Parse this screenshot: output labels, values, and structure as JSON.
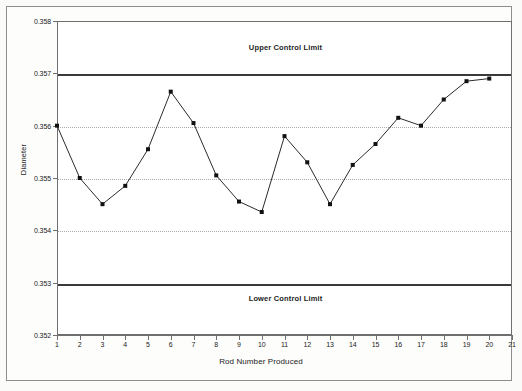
{
  "chart_data": {
    "type": "line",
    "title": "",
    "xlabel": "Rod Number Produced",
    "ylabel": "Diameter",
    "xlim": [
      1,
      21
    ],
    "ylim": [
      0.352,
      0.358
    ],
    "grid": true,
    "legend": "none",
    "x_ticks": [
      "1",
      "2",
      "3",
      "4",
      "5",
      "6",
      "7",
      "8",
      "9",
      "10",
      "11",
      "12",
      "13",
      "14",
      "15",
      "16",
      "17",
      "18",
      "19",
      "20",
      "21"
    ],
    "y_ticks": [
      "0.352",
      "0.353",
      "0.354",
      "0.355",
      "0.356",
      "0.357",
      "0.358"
    ],
    "x": [
      1,
      2,
      3,
      4,
      5,
      6,
      7,
      8,
      9,
      10,
      11,
      12,
      13,
      14,
      15,
      16,
      17,
      18,
      19,
      20
    ],
    "categories": [
      "1",
      "2",
      "3",
      "4",
      "5",
      "6",
      "7",
      "8",
      "9",
      "10",
      "11",
      "12",
      "13",
      "14",
      "15",
      "16",
      "17",
      "18",
      "19",
      "20"
    ],
    "values": [
      0.356,
      0.355,
      0.3545,
      0.35485,
      0.35555,
      0.35665,
      0.35605,
      0.35505,
      0.35455,
      0.35435,
      0.3558,
      0.3553,
      0.3545,
      0.35525,
      0.35565,
      0.35615,
      0.356,
      0.3565,
      0.35685,
      0.3569
    ],
    "series": [
      {
        "name": "Diameter",
        "values": [
          0.356,
          0.355,
          0.3545,
          0.35485,
          0.35555,
          0.35665,
          0.35605,
          0.35505,
          0.35455,
          0.35435,
          0.3558,
          0.3553,
          0.3545,
          0.35525,
          0.35565,
          0.35615,
          0.356,
          0.3565,
          0.35685,
          0.3569
        ]
      }
    ],
    "control_limits": [
      {
        "name": "upper-control-limit",
        "label": "Upper Control Limit",
        "value": 0.357
      },
      {
        "name": "lower-control-limit",
        "label": "Lower Control Limit",
        "value": 0.353
      }
    ],
    "annotations": [
      {
        "text": "Upper Control Limit",
        "x": 11,
        "y": 0.3575
      },
      {
        "text": "Lower Control Limit",
        "x": 11,
        "y": 0.3527
      }
    ],
    "colors": {
      "series_line": "#2b2b2b",
      "marker": "#111111",
      "gridline": "#a9a9a9",
      "limit_line": "#3a3a3a",
      "axis": "#6f6f6f",
      "plot_background": "#ffffff",
      "page_background": "#fbfbfa"
    }
  }
}
